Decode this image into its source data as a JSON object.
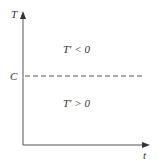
{
  "diagram": {
    "y_axis_label": "T",
    "x_axis_label": "t",
    "level_label": "C",
    "region_above": "T′ < 0",
    "region_below": "T′ > 0",
    "colors": {
      "axis": "#555555",
      "dash": "#555555",
      "text": "#333333"
    }
  }
}
